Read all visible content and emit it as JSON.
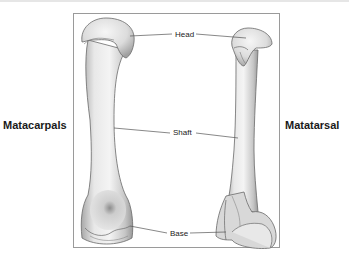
{
  "diagram": {
    "left_bone_label": "Matacarpals",
    "right_bone_label": "Matatarsal",
    "callouts": {
      "head": "Head",
      "shaft": "Shaft",
      "base": "Base"
    },
    "colors": {
      "bone_light": "#f2f2f2",
      "bone_mid": "#d4d4d4",
      "bone_dark": "#9c9c9c",
      "outline": "#6a6a6a",
      "leader_line": "#555555",
      "frame_border": "#9a9a9a"
    }
  }
}
